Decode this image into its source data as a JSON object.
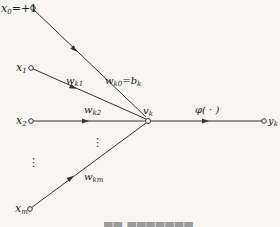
{
  "diagram": {
    "type": "neuron-model",
    "colors": {
      "line": "#333333",
      "text": "#222222",
      "background": "#f7f6f3"
    },
    "inputs": [
      {
        "id": "x0",
        "label": "x",
        "sub": "0",
        "suffix": "=+1",
        "weight": "w",
        "weight_sub": "k0",
        "weight_suffix": "=b",
        "weight_suffix_sub": "k"
      },
      {
        "id": "x1",
        "label": "x",
        "sub": "1",
        "weight": "w",
        "weight_sub": "k1"
      },
      {
        "id": "x2",
        "label": "x",
        "sub": "2",
        "weight": "w",
        "weight_sub": "k2"
      },
      {
        "id": "xm",
        "label": "x",
        "sub": "m",
        "weight": "w",
        "weight_sub": "km"
      }
    ],
    "ellipsis": "⋮",
    "summing_node": {
      "label": "v",
      "sub": "k"
    },
    "activation": {
      "label": "φ( · )"
    },
    "output": {
      "label": "y",
      "sub": "k"
    },
    "caption": "(caption truncated at image edge)"
  }
}
